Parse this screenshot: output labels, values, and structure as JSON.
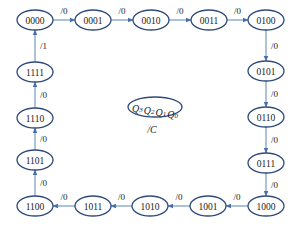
{
  "diagram": {
    "type": "state-transition",
    "legend": {
      "state_vars": [
        "Q3",
        "Q2",
        "Q1",
        "Q0"
      ],
      "output": "/C"
    },
    "states": [
      {
        "id": "0000",
        "x": 35,
        "y": 20
      },
      {
        "id": "0001",
        "x": 93,
        "y": 20
      },
      {
        "id": "0010",
        "x": 151,
        "y": 20
      },
      {
        "id": "0011",
        "x": 209,
        "y": 20
      },
      {
        "id": "0100",
        "x": 266,
        "y": 20
      },
      {
        "id": "0101",
        "x": 266,
        "y": 71
      },
      {
        "id": "0110",
        "x": 266,
        "y": 117
      },
      {
        "id": "0111",
        "x": 266,
        "y": 163
      },
      {
        "id": "1000",
        "x": 266,
        "y": 206
      },
      {
        "id": "1001",
        "x": 208,
        "y": 206
      },
      {
        "id": "1010",
        "x": 150,
        "y": 206
      },
      {
        "id": "1011",
        "x": 93,
        "y": 206
      },
      {
        "id": "1100",
        "x": 35,
        "y": 206
      },
      {
        "id": "1101",
        "x": 35,
        "y": 160
      },
      {
        "id": "1110",
        "x": 35,
        "y": 118
      },
      {
        "id": "1111",
        "x": 35,
        "y": 72
      }
    ],
    "transitions": [
      {
        "from": "0000",
        "to": "0001",
        "label": "/0"
      },
      {
        "from": "0001",
        "to": "0010",
        "label": "/0"
      },
      {
        "from": "0010",
        "to": "0011",
        "label": "/0"
      },
      {
        "from": "0011",
        "to": "0100",
        "label": "/0"
      },
      {
        "from": "0100",
        "to": "0101",
        "label": "/0"
      },
      {
        "from": "0101",
        "to": "0110",
        "label": "/0"
      },
      {
        "from": "0110",
        "to": "0111",
        "label": "/0"
      },
      {
        "from": "0111",
        "to": "1000",
        "label": "/0"
      },
      {
        "from": "1000",
        "to": "1001",
        "label": "/0"
      },
      {
        "from": "1001",
        "to": "1010",
        "label": "/0"
      },
      {
        "from": "1010",
        "to": "1011",
        "label": "/0"
      },
      {
        "from": "1011",
        "to": "1100",
        "label": "/0"
      },
      {
        "from": "1100",
        "to": "1101",
        "label": "/0"
      },
      {
        "from": "1101",
        "to": "1110",
        "label": "/0"
      },
      {
        "from": "1110",
        "to": "1111",
        "label": "/0"
      },
      {
        "from": "1111",
        "to": "0000",
        "label": "/1"
      }
    ]
  }
}
